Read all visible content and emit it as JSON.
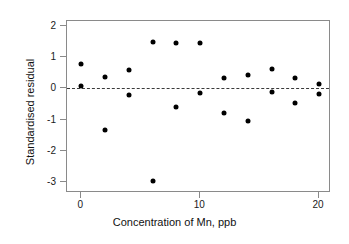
{
  "chart_data": {
    "type": "scatter",
    "title": "",
    "xlabel": "Concentration of Mn, ppb",
    "ylabel": "Standardised residual",
    "xlim": [
      -1.2,
      21.0
    ],
    "ylim": [
      -3.35,
      2.15
    ],
    "xticks": [
      0,
      10,
      20
    ],
    "xtick_labels": [
      "0",
      "10",
      "20"
    ],
    "yticks": [
      2,
      1,
      0,
      -1,
      -2,
      -3
    ],
    "ytick_labels": [
      "2",
      "1",
      "0",
      "-1",
      "-2",
      "-3"
    ],
    "grid": false,
    "legend": null,
    "reference_line": {
      "y": 0,
      "style": "dashed",
      "color": "#3a3a3a"
    },
    "marker": {
      "shape": "circle",
      "filled": true,
      "color": "#000000",
      "size": 5
    },
    "points": [
      {
        "x": 0,
        "y": 0.78
      },
      {
        "x": 0,
        "y": 0.08
      },
      {
        "x": 2,
        "y": 0.37
      },
      {
        "x": 2,
        "y": -1.33
      },
      {
        "x": 4,
        "y": 0.57
      },
      {
        "x": 4,
        "y": -0.21
      },
      {
        "x": 6,
        "y": 1.47
      },
      {
        "x": 6,
        "y": -2.96
      },
      {
        "x": 8,
        "y": 1.45
      },
      {
        "x": 8,
        "y": -0.6
      },
      {
        "x": 10,
        "y": 1.44
      },
      {
        "x": 10,
        "y": -0.16
      },
      {
        "x": 12,
        "y": 0.34
      },
      {
        "x": 12,
        "y": -0.8
      },
      {
        "x": 14,
        "y": 0.43
      },
      {
        "x": 14,
        "y": -1.05
      },
      {
        "x": 16,
        "y": 0.61
      },
      {
        "x": 16,
        "y": -0.12
      },
      {
        "x": 18,
        "y": 0.32
      },
      {
        "x": 18,
        "y": -0.46
      },
      {
        "x": 20,
        "y": 0.15
      },
      {
        "x": 20,
        "y": -0.19
      }
    ]
  }
}
